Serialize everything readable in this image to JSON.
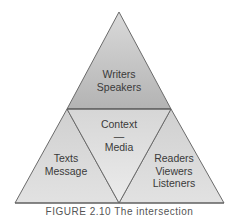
{
  "diagram": {
    "type": "triangle-of-triangles",
    "colors": {
      "top_fill": "#b7b7b7",
      "top_fill_light": "#d4d4d4",
      "side_fill": "#d9d9d9",
      "center_fill": "#e6e6e6",
      "stroke": "#6b6b6b",
      "text": "#3a3a3a"
    },
    "sections": {
      "top": {
        "line1": "Writers",
        "line2": "Speakers"
      },
      "center": {
        "line1": "Context",
        "line2": "—",
        "line3": "Media"
      },
      "left": {
        "line1": "Texts",
        "line2": "Message"
      },
      "right": {
        "line1": "Readers",
        "line2": "Viewers",
        "line3": "Listeners"
      }
    },
    "caption": "FIGURE 2.10 The intersection"
  }
}
